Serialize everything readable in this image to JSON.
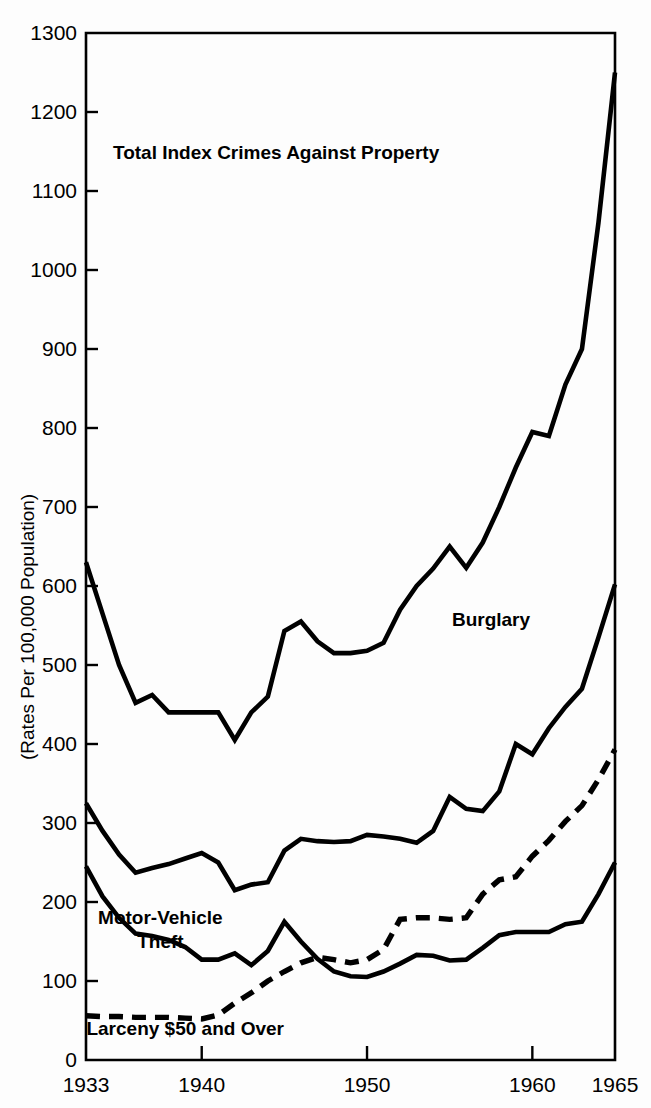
{
  "chart_data": {
    "type": "line",
    "title": "",
    "xlabel": "",
    "ylabel": "(Rates Per 100,000 Population)",
    "xlim": [
      1933,
      1965
    ],
    "ylim": [
      0,
      1300
    ],
    "grid": false,
    "legend_position": "inline-annotations",
    "x_ticks": [
      1933,
      1940,
      1950,
      1960,
      1965
    ],
    "x_tick_labels": [
      "1933",
      "1940",
      "1950",
      "1960",
      "1965"
    ],
    "y_ticks": [
      0,
      100,
      200,
      300,
      400,
      500,
      600,
      700,
      800,
      900,
      1000,
      1100,
      1200,
      1300
    ],
    "y_tick_labels": [
      "0",
      "100",
      "200",
      "300",
      "400",
      "500",
      "600",
      "700",
      "800",
      "900",
      "1000",
      "1100",
      "1200",
      "1300"
    ],
    "x": [
      1933,
      1934,
      1935,
      1936,
      1937,
      1938,
      1939,
      1940,
      1941,
      1942,
      1943,
      1944,
      1945,
      1946,
      1947,
      1948,
      1949,
      1950,
      1951,
      1952,
      1953,
      1954,
      1955,
      1956,
      1957,
      1958,
      1959,
      1960,
      1961,
      1962,
      1963,
      1964,
      1965
    ],
    "series": [
      {
        "name": "Total Index Crimes Against Property",
        "style": "solid",
        "label_x": 1944.5,
        "label_y": 1140,
        "values": [
          630,
          565,
          500,
          452,
          462,
          440,
          440,
          440,
          440,
          405,
          440,
          460,
          543,
          555,
          530,
          515,
          515,
          518,
          528,
          570,
          600,
          622,
          650,
          623,
          655,
          700,
          750,
          795,
          790,
          855,
          900,
          1060,
          1250
        ]
      },
      {
        "name": "Burglary",
        "style": "solid",
        "label_x": 1957.5,
        "label_y": 550,
        "values": [
          325,
          290,
          260,
          237,
          243,
          248,
          255,
          262,
          250,
          215,
          222,
          225,
          265,
          280,
          277,
          276,
          277,
          285,
          283,
          280,
          275,
          290,
          333,
          318,
          315,
          340,
          400,
          387,
          420,
          447,
          470,
          535,
          602
        ]
      },
      {
        "name": "Motor-Vehicle Theft",
        "style": "solid",
        "label_x": 1937.5,
        "label_y": 172,
        "values": [
          245,
          207,
          180,
          160,
          157,
          152,
          143,
          127,
          127,
          135,
          120,
          138,
          175,
          150,
          128,
          112,
          106,
          105,
          112,
          122,
          133,
          132,
          126,
          127,
          142,
          158,
          162,
          162,
          162,
          172,
          175,
          210,
          250
        ]
      },
      {
        "name": "Larceny $50 and Over",
        "style": "dashed",
        "label_x": 1939.0,
        "label_y": 32,
        "values": [
          56,
          55,
          55,
          54,
          54,
          54,
          53,
          52,
          57,
          72,
          85,
          100,
          112,
          123,
          130,
          127,
          123,
          127,
          140,
          178,
          180,
          180,
          178,
          180,
          210,
          228,
          232,
          258,
          278,
          302,
          322,
          355,
          393
        ]
      }
    ]
  }
}
